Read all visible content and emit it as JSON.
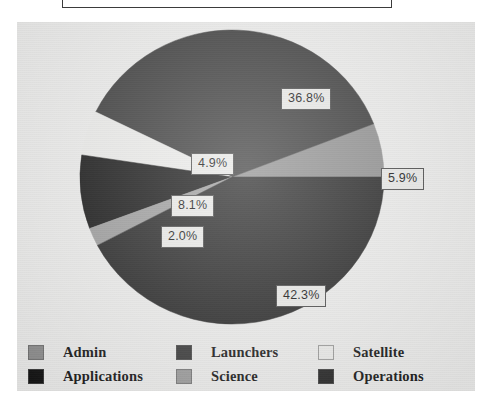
{
  "figure": {
    "background_color": "#ececeb",
    "page_color": "#ffffff",
    "label_box_fill": "#e9e9e7",
    "label_box_border": "#4a4a4a"
  },
  "chart_data": {
    "type": "pie",
    "title": "",
    "subtitle": "",
    "xlabel": "",
    "ylabel": "",
    "grid": false,
    "legend_position": "bottom",
    "label_format": "percent-one-decimal",
    "start_angle_deg": 0,
    "direction": "counterclockwise",
    "categories": [
      "Admin",
      "Launchers",
      "Satellite",
      "Applications",
      "Science",
      "Operations"
    ],
    "values": [
      5.9,
      36.8,
      4.9,
      8.1,
      2.0,
      42.3
    ],
    "labels": [
      "5.9%",
      "36.8%",
      "4.9%",
      "8.1%",
      "2.0%",
      "42.3%"
    ],
    "colors": [
      "#8f8f8f",
      "#3a3a3a",
      "#ebebe9",
      "#151515",
      "#9c9c9c",
      "#262626"
    ],
    "slices": [
      {
        "name": "Admin",
        "value": 5.9,
        "label": "5.9%",
        "color": "#8f8f8f",
        "start_deg": 0,
        "end_deg": 21.24,
        "label_x": 309,
        "label_y": 141
      },
      {
        "name": "Launchers",
        "value": 36.8,
        "label": "36.8%",
        "color": "#3a3a3a",
        "start_deg": 21.24,
        "end_deg": 153.72,
        "label_x": 209,
        "label_y": 61
      },
      {
        "name": "Satellite",
        "value": 4.9,
        "label": "4.9%",
        "color": "#ebebe9",
        "start_deg": 153.72,
        "end_deg": 171.36,
        "label_x": 119,
        "label_y": 126
      },
      {
        "name": "Applications",
        "value": 8.1,
        "label": "8.1%",
        "color": "#151515",
        "start_deg": 171.36,
        "end_deg": 200.52,
        "label_x": 99,
        "label_y": 168
      },
      {
        "name": "Science",
        "value": 2.0,
        "label": "2.0%",
        "color": "#9c9c9c",
        "start_deg": 200.52,
        "end_deg": 207.72,
        "label_x": 89,
        "label_y": 199
      },
      {
        "name": "Operations",
        "value": 42.3,
        "label": "42.3%",
        "color": "#262626",
        "start_deg": 207.72,
        "end_deg": 360,
        "label_x": 204,
        "label_y": 258
      }
    ]
  },
  "legend": {
    "columns": [
      {
        "items": [
          {
            "label": "Admin",
            "color": "#8f8f8f"
          },
          {
            "label": "Applications",
            "color": "#151515"
          }
        ]
      },
      {
        "items": [
          {
            "label": "Launchers",
            "color": "#3a3a3a"
          },
          {
            "label": "Science",
            "color": "#9c9c9c"
          }
        ]
      },
      {
        "items": [
          {
            "label": "Satellite",
            "color": "#ebebe9"
          },
          {
            "label": "Operations",
            "color": "#262626"
          }
        ]
      }
    ]
  }
}
